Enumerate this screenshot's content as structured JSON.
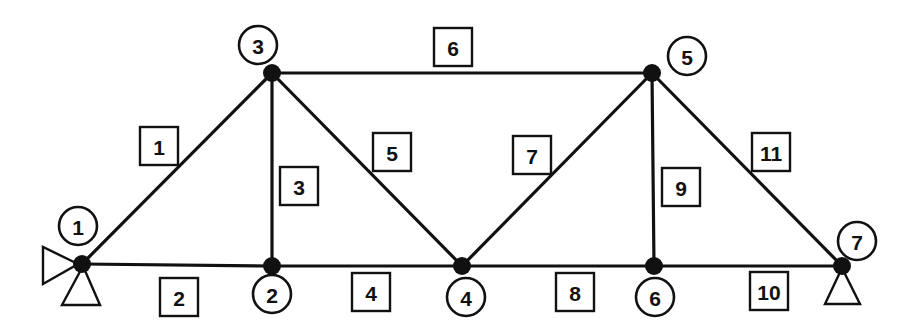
{
  "diagram": {
    "type": "truss",
    "nodes": [
      {
        "id": "1",
        "label": "1",
        "x": 82,
        "y": 264,
        "label_x": 78,
        "label_y": 226
      },
      {
        "id": "2",
        "label": "2",
        "x": 272,
        "y": 266,
        "label_x": 272,
        "label_y": 294
      },
      {
        "id": "3",
        "label": "3",
        "x": 272,
        "y": 73,
        "label_x": 258,
        "label_y": 45
      },
      {
        "id": "4",
        "label": "4",
        "x": 462,
        "y": 266,
        "label_x": 466,
        "label_y": 297
      },
      {
        "id": "5",
        "label": "5",
        "x": 652,
        "y": 73,
        "label_x": 687,
        "label_y": 56
      },
      {
        "id": "6",
        "label": "6",
        "x": 654,
        "y": 266,
        "label_x": 655,
        "label_y": 297
      },
      {
        "id": "7",
        "label": "7",
        "x": 842,
        "y": 266,
        "label_x": 857,
        "label_y": 241
      }
    ],
    "members": [
      {
        "id": "1",
        "label": "1",
        "from": "1",
        "to": "3",
        "box_x": 140,
        "box_y": 127
      },
      {
        "id": "2",
        "label": "2",
        "from": "1",
        "to": "2",
        "box_x": 160,
        "box_y": 278
      },
      {
        "id": "3",
        "label": "3",
        "from": "2",
        "to": "3",
        "box_x": 280,
        "box_y": 167
      },
      {
        "id": "4",
        "label": "4",
        "from": "2",
        "to": "4",
        "box_x": 352,
        "box_y": 273
      },
      {
        "id": "5",
        "label": "5",
        "from": "3",
        "to": "4",
        "box_x": 373,
        "box_y": 133
      },
      {
        "id": "6",
        "label": "6",
        "from": "3",
        "to": "5",
        "box_x": 434,
        "box_y": 28
      },
      {
        "id": "7",
        "label": "7",
        "from": "4",
        "to": "5",
        "box_x": 513,
        "box_y": 136
      },
      {
        "id": "8",
        "label": "8",
        "from": "4",
        "to": "6",
        "box_x": 556,
        "box_y": 273
      },
      {
        "id": "9",
        "label": "9",
        "from": "5",
        "to": "6",
        "box_x": 662,
        "box_y": 168
      },
      {
        "id": "10",
        "label": "10",
        "from": "6",
        "to": "7",
        "box_x": 750,
        "box_y": 272
      },
      {
        "id": "11",
        "label": "11",
        "from": "5",
        "to": "7",
        "box_x": 752,
        "box_y": 133
      }
    ],
    "supports": [
      {
        "node": "1",
        "type": "pin",
        "note": "horizontal + vertical triangle restraints"
      },
      {
        "node": "7",
        "type": "roller",
        "note": "vertical triangle restraint"
      }
    ],
    "colors": {
      "line": "#111111",
      "background": "#ffffff"
    }
  }
}
